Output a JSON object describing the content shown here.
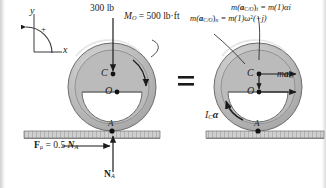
{
  "figure": {
    "type": "free-body-and-kinetic-diagram",
    "equals_sign": "=",
    "axes": {
      "x_label": "x",
      "y_label": "y",
      "sense_label": "+",
      "sense": "counterclockwise-positive"
    },
    "left_diagram": {
      "name": "free-body-diagram",
      "applied_force": {
        "label": "300 lb",
        "direction": "downward",
        "applied_at": "C"
      },
      "applied_moment": {
        "label_prefix": "M",
        "label_sub": "O",
        "label_value": " = 500 lb·ft",
        "full": "M_O = 500 lb·ft",
        "sense": "clockwise"
      },
      "points": [
        {
          "id": "C",
          "label": "C"
        },
        {
          "id": "O",
          "label": "O"
        },
        {
          "id": "A",
          "label": "A"
        }
      ],
      "friction_force": {
        "full": "Fμ = 0.5 N_A",
        "bold_F": "F",
        "sub_mu": "μ",
        "eq": " = 0.5 ",
        "bold_N": "N",
        "sub_A": "A",
        "direction": "right"
      },
      "normal_force": {
        "bold_N": "N",
        "sub_A": "A",
        "full": "N_A",
        "direction": "up"
      }
    },
    "right_diagram": {
      "name": "kinetic-diagram",
      "tangential_term": {
        "full": "m(a_C/O)_t = m(1)αi",
        "lhs_m": "m(",
        "lhs_a": "a",
        "lhs_sub": "C/O",
        "lhs_close": ")",
        "lhs_tsub": "t",
        "rhs": " = m(1)αi"
      },
      "normal_term": {
        "full": "m(a_C/O)_n = m(1)ω²(−j)",
        "lhs_m": "m(",
        "lhs_a": "a",
        "lhs_sub": "C/O",
        "lhs_close": ")",
        "lhs_nsub": "n",
        "rhs_pre": " = m(1)ω",
        "rhs_sup": "2",
        "rhs_post": "(−j)"
      },
      "mass_accel_term": {
        "full": "ma_O",
        "m": "m",
        "a": "a",
        "sub": "O",
        "direction": "right"
      },
      "moment_inertia_term": {
        "full": "I_C α",
        "I": "I",
        "sub": "C",
        "alpha": "α",
        "sense": "counterclockwise"
      },
      "points": [
        {
          "id": "C",
          "label": "C"
        },
        {
          "id": "O",
          "label": "O"
        },
        {
          "id": "A",
          "label": "A"
        }
      ]
    },
    "colors": {
      "body_fill": "#b5b5b5",
      "body_rim": "#9a9a9a",
      "body_light": "#d2d2d2",
      "ground": "#c9c9c9",
      "ink": "#1b1b1b",
      "page": "#ffffff"
    }
  }
}
